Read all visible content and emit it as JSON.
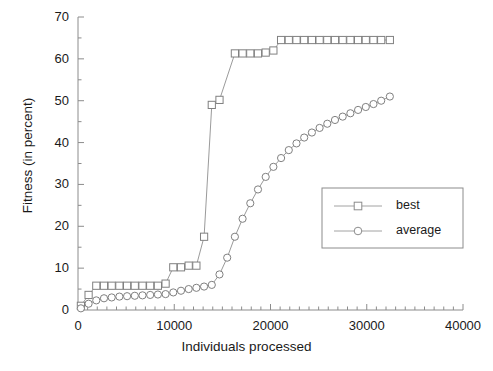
{
  "chart_data": {
    "type": "line",
    "title": "",
    "xlabel": "Individuals processed",
    "ylabel": "Fitness (in percent)",
    "xlim": [
      0,
      40000
    ],
    "ylim": [
      0,
      70
    ],
    "xticks": [
      0,
      10000,
      20000,
      30000,
      40000
    ],
    "yticks": [
      0,
      10,
      20,
      30,
      40,
      50,
      60,
      70
    ],
    "xtick_labels": [
      "0",
      "10000",
      "20000",
      "30000",
      "40000"
    ],
    "ytick_labels": [
      "0",
      "10",
      "20",
      "30",
      "40",
      "50",
      "60",
      "70"
    ],
    "x_minor_step": 1000,
    "y_minor_step": 5,
    "grid": false,
    "legend_position": "lower-right",
    "series": [
      {
        "name": "best",
        "marker": "square",
        "color": "#808080",
        "points": [
          [
            300,
            1.0
          ],
          [
            1100,
            3.6
          ],
          [
            1900,
            5.8
          ],
          [
            2700,
            5.8
          ],
          [
            3500,
            5.8
          ],
          [
            4300,
            5.8
          ],
          [
            5100,
            5.8
          ],
          [
            5900,
            5.8
          ],
          [
            6700,
            5.8
          ],
          [
            7500,
            5.8
          ],
          [
            8300,
            5.8
          ],
          [
            9100,
            6.3
          ],
          [
            9900,
            10.2
          ],
          [
            10700,
            10.2
          ],
          [
            11500,
            10.6
          ],
          [
            12300,
            10.6
          ],
          [
            13100,
            17.5
          ],
          [
            13900,
            49.0
          ],
          [
            14700,
            50.2
          ],
          [
            16300,
            61.3
          ],
          [
            17100,
            61.3
          ],
          [
            17900,
            61.3
          ],
          [
            18700,
            61.3
          ],
          [
            19500,
            61.5
          ],
          [
            20300,
            62.0
          ],
          [
            21100,
            64.5
          ],
          [
            21900,
            64.5
          ],
          [
            22700,
            64.5
          ],
          [
            23500,
            64.5
          ],
          [
            24300,
            64.5
          ],
          [
            25100,
            64.5
          ],
          [
            25900,
            64.5
          ],
          [
            26700,
            64.5
          ],
          [
            27500,
            64.5
          ],
          [
            28300,
            64.5
          ],
          [
            29100,
            64.5
          ],
          [
            29900,
            64.5
          ],
          [
            30700,
            64.5
          ],
          [
            31500,
            64.5
          ],
          [
            32400,
            64.5
          ]
        ]
      },
      {
        "name": "average",
        "marker": "circle",
        "color": "#808080",
        "points": [
          [
            300,
            0.4
          ],
          [
            1100,
            1.5
          ],
          [
            1900,
            2.3
          ],
          [
            2700,
            2.8
          ],
          [
            3500,
            3.0
          ],
          [
            4300,
            3.2
          ],
          [
            5100,
            3.3
          ],
          [
            5900,
            3.4
          ],
          [
            6700,
            3.5
          ],
          [
            7500,
            3.6
          ],
          [
            8300,
            3.7
          ],
          [
            9100,
            3.8
          ],
          [
            9900,
            4.2
          ],
          [
            10700,
            4.6
          ],
          [
            11500,
            5.0
          ],
          [
            12300,
            5.3
          ],
          [
            13100,
            5.6
          ],
          [
            13900,
            6.0
          ],
          [
            14700,
            8.5
          ],
          [
            15500,
            12.5
          ],
          [
            16300,
            17.5
          ],
          [
            17100,
            21.8
          ],
          [
            17900,
            25.5
          ],
          [
            18700,
            28.8
          ],
          [
            19500,
            31.8
          ],
          [
            20300,
            34.2
          ],
          [
            21100,
            36.3
          ],
          [
            21900,
            38.2
          ],
          [
            22700,
            39.8
          ],
          [
            23500,
            41.2
          ],
          [
            24300,
            42.4
          ],
          [
            25100,
            43.5
          ],
          [
            25900,
            44.5
          ],
          [
            26700,
            45.4
          ],
          [
            27500,
            46.2
          ],
          [
            28300,
            47.0
          ],
          [
            29100,
            47.8
          ],
          [
            29900,
            48.5
          ],
          [
            30700,
            49.2
          ],
          [
            31500,
            50.0
          ],
          [
            32400,
            51.0
          ]
        ]
      }
    ]
  },
  "legend": {
    "entries": [
      {
        "label": "best",
        "marker": "square"
      },
      {
        "label": "average",
        "marker": "circle"
      }
    ]
  }
}
